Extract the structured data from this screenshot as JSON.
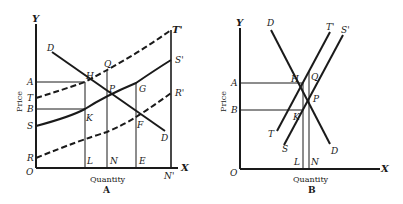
{
  "diagram_a": {
    "caption": "A",
    "x_axis_label": "Quantity",
    "y_axis_label": "Price",
    "axis_names": {
      "y": "Y",
      "x": "X",
      "origin": "O"
    },
    "price_labels": {
      "A": "A",
      "T": "T",
      "B": "B",
      "S": "S",
      "R": "R"
    },
    "quantity_labels": {
      "L": "L",
      "N": "N",
      "E": "E",
      "N_prime": "N'"
    },
    "point_labels": {
      "H": "H",
      "Q": "Q",
      "P": "P",
      "G": "G",
      "K": "K",
      "F": "F"
    },
    "curve_labels": {
      "D_top": "D",
      "D_bottom": "D",
      "T_prime": "T'",
      "S_prime": "S'",
      "R_prime": "R'"
    }
  },
  "diagram_b": {
    "caption": "B",
    "x_axis_label": "Quantity",
    "y_axis_label": "Price",
    "axis_names": {
      "y": "Y",
      "x": "X",
      "origin": "O"
    },
    "price_labels": {
      "A": "A",
      "B": "B"
    },
    "quantity_labels": {
      "L": "L",
      "N": "N"
    },
    "point_labels": {
      "H": "H",
      "Q": "Q",
      "P": "P",
      "K": "K"
    },
    "curve_labels": {
      "D_top": "D",
      "D_bottom": "D",
      "T_prime": "T'",
      "S_prime": "S'",
      "T": "T",
      "S": "S"
    }
  },
  "colors": {
    "ink": "#1a1a1a",
    "paper": "#ffffff"
  }
}
